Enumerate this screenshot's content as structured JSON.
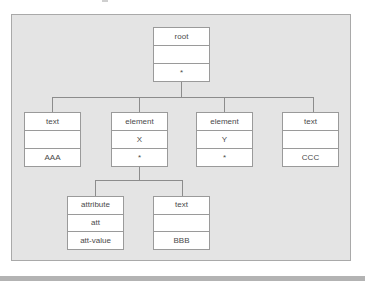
{
  "diagram": {
    "type": "tree",
    "colors": {
      "panel_background": "#e4e4e4",
      "panel_border": "#a9a9a9",
      "node_background": "#ffffff",
      "node_border": "#9a9a9a",
      "connector": "#8c8c8c",
      "text": "#4a4a4a",
      "bottom_bar": "#b3b3b3"
    },
    "nodes": {
      "root": {
        "type": "root",
        "name": "",
        "value": "*"
      },
      "text_aaa": {
        "type": "text",
        "name": "",
        "value": "AAA"
      },
      "element_x": {
        "type": "element",
        "name": "X",
        "value": "*"
      },
      "element_y": {
        "type": "element",
        "name": "Y",
        "value": "*"
      },
      "text_ccc": {
        "type": "text",
        "name": "",
        "value": "CCC"
      },
      "attribute_att": {
        "type": "attribute",
        "name": "att",
        "value": "att-value"
      },
      "text_bbb": {
        "type": "text",
        "name": "",
        "value": "BBB"
      }
    },
    "edges": [
      {
        "from": "root",
        "to": "text_aaa"
      },
      {
        "from": "root",
        "to": "element_x"
      },
      {
        "from": "root",
        "to": "element_y"
      },
      {
        "from": "root",
        "to": "text_ccc"
      },
      {
        "from": "element_x",
        "to": "attribute_att"
      },
      {
        "from": "element_x",
        "to": "text_bbb"
      }
    ]
  }
}
